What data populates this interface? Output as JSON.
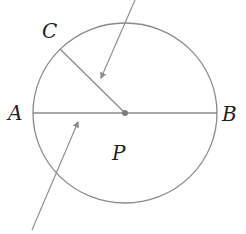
{
  "diagram": {
    "type": "circle-geometry",
    "labels": {
      "A": "A",
      "B": "B",
      "C": "C",
      "P": "P"
    },
    "colors": {
      "stroke": "#8a8a8a",
      "center_dot": "#7a7a7a",
      "label": "#222222"
    },
    "elements": [
      {
        "name": "circle",
        "center": [
          125,
          113
        ],
        "rx": 92,
        "ry": 90
      },
      {
        "name": "diameter-AB",
        "from": "A",
        "to": "B"
      },
      {
        "name": "radius-PC",
        "from": "center",
        "to": "C"
      },
      {
        "name": "arrow-upper",
        "points_to": "sector near radius PC"
      },
      {
        "name": "arrow-lower",
        "points_to": "diameter AB region"
      }
    ]
  }
}
